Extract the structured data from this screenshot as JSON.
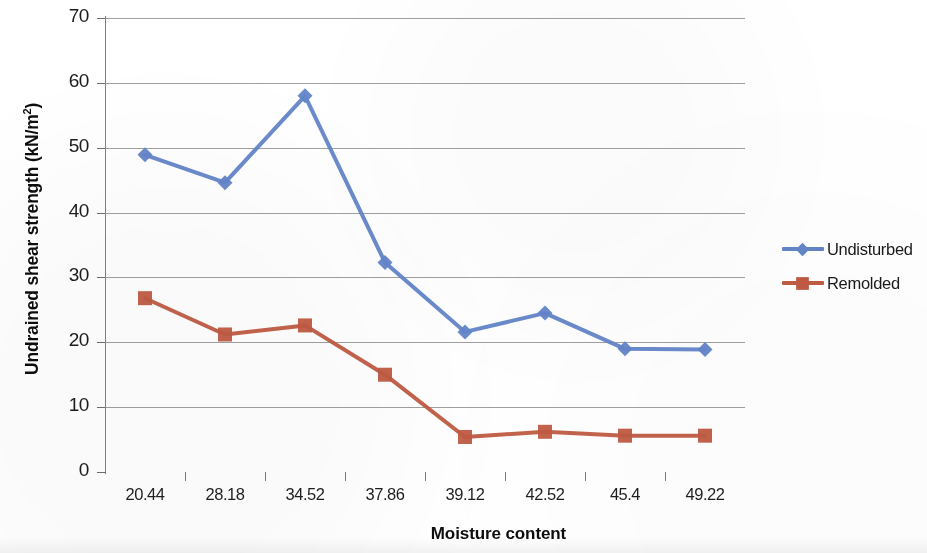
{
  "axes": {
    "y_title_main": "Undrained shear strength (kN/m",
    "y_title_sup": "2",
    "y_title_tail": ")",
    "x_title": "Moisture content"
  },
  "legend": {
    "position": "right",
    "items": [
      {
        "label": "Undisturbed",
        "color": "#6385C9",
        "marker": "diamond"
      },
      {
        "label": "Remolded",
        "color": "#C05B42",
        "marker": "square"
      }
    ]
  },
  "colors": {
    "undisturbed": "#6385C9",
    "remolded": "#C05B42",
    "gridline": "#8f8f8f",
    "text": "#1a1a1a",
    "background": "#ffffff"
  },
  "y_ticks": [
    "0",
    "10",
    "20",
    "30",
    "40",
    "50",
    "60",
    "70"
  ],
  "x_ticks": [
    "20.44",
    "28.18",
    "34.52",
    "37.86",
    "39.12",
    "42.52",
    "45.4",
    "49.22"
  ],
  "chart_data": {
    "type": "line",
    "title": "",
    "subtitle": "",
    "xlabel": "Moisture content",
    "ylabel": "Undrained shear strength (kN/m2)",
    "categories": [
      "20.44",
      "28.18",
      "34.52",
      "37.86",
      "39.12",
      "42.52",
      "45.4",
      "49.22"
    ],
    "ylim": [
      0,
      70
    ],
    "ytick_step": 10,
    "grid": true,
    "legend_position": "right",
    "series": [
      {
        "name": "Undisturbed",
        "color": "#6385C9",
        "marker": "diamond",
        "values": [
          48.9,
          44.6,
          58.0,
          32.3,
          21.6,
          24.5,
          19.0,
          18.9
        ]
      },
      {
        "name": "Remolded",
        "color": "#C05B42",
        "marker": "square",
        "values": [
          26.8,
          21.2,
          22.6,
          15.0,
          5.4,
          6.2,
          5.6,
          5.6
        ]
      }
    ]
  }
}
